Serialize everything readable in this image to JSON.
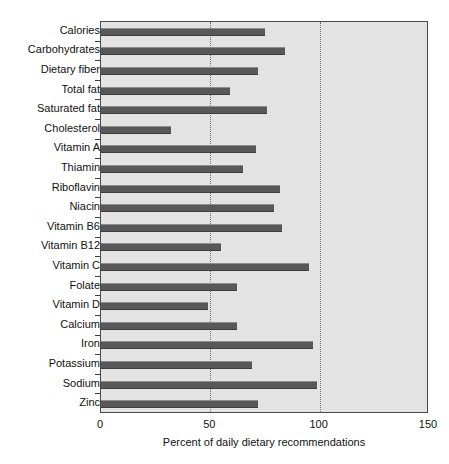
{
  "chart_data": {
    "type": "bar",
    "orientation": "horizontal",
    "title": "",
    "xlabel": "Percent of daily dietary recommendations",
    "ylabel": "",
    "xlim": [
      0,
      150
    ],
    "xticks": [
      0,
      50,
      100,
      150
    ],
    "xtick_labels": [
      "0",
      "50",
      "100",
      "150"
    ],
    "grid": "vertical dotted gridlines at 50 and 100",
    "legend": "none",
    "plot_background": "#e3e3e3",
    "bar_color": "#585858",
    "categories": [
      "Calories",
      "Carbohydrates",
      "Dietary fiber",
      "Total fat",
      "Saturated fat",
      "Cholesterol",
      "Vitamin A",
      "Thiamin",
      "Riboflavin",
      "Niacin",
      "Vitamin B6",
      "Vitamin B12",
      "Vitamin C",
      "Folate",
      "Vitamin D",
      "Calcium",
      "Iron",
      "Potassium",
      "Sodium",
      "Zinc"
    ],
    "values": [
      75,
      84,
      72,
      59,
      76,
      32,
      71,
      65,
      82,
      79,
      83,
      55,
      95,
      62,
      49,
      62,
      97,
      69,
      99,
      72
    ]
  }
}
